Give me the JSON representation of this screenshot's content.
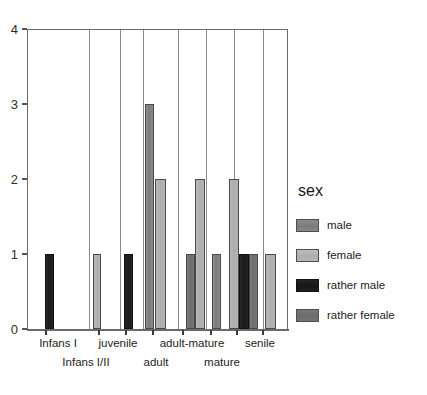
{
  "top_strip": {
    "text": "· · · ·  · ·   ·     · ·"
  },
  "chart_data": {
    "type": "bar",
    "title": "",
    "subtitle": "",
    "xlabel": "",
    "ylabel": "",
    "ylim": [
      0,
      4
    ],
    "yticks": [
      0,
      1,
      2,
      3,
      4
    ],
    "ytick_labels": [
      "0",
      "1",
      "2",
      "3",
      "4"
    ],
    "grid": false,
    "legend_position": "right",
    "legend_title": "sex",
    "categories": [
      "Infans I",
      "Infans I/II",
      "juvenile",
      "adult",
      "adult-mature",
      "mature",
      "senile"
    ],
    "category_rows": {
      "row1": [
        "Infans I",
        "juvenile",
        "adult-mature",
        "senile"
      ],
      "row2": [
        "Infans I/II",
        "adult",
        "mature"
      ]
    },
    "series": [
      {
        "name": "male",
        "color": "#808080",
        "values": [
          0,
          0,
          0,
          3,
          1,
          2,
          1
        ]
      },
      {
        "name": "female",
        "color": "#b3b3b3",
        "values": [
          0,
          0,
          1,
          2,
          2,
          1,
          1
        ]
      },
      {
        "name": "rather male",
        "color": "#1c1c1c",
        "values": [
          1,
          0,
          1,
          0,
          0,
          1,
          0
        ]
      },
      {
        "name": "rather female",
        "color": "#737373",
        "values": [
          0,
          0,
          0,
          0,
          1,
          1,
          0
        ]
      }
    ],
    "bars": [
      {
        "group": "Infans I",
        "series": "rather male",
        "value": 1,
        "x": 44,
        "w": 9
      },
      {
        "group": "juvenile",
        "series": "female",
        "value": 1,
        "x": 92,
        "w": 8
      },
      {
        "group": "juvenile",
        "series": "rather male",
        "value": 1,
        "x": 123,
        "w": 9
      },
      {
        "group": "adult",
        "series": "male",
        "value": 3,
        "x": 144,
        "w": 9
      },
      {
        "group": "adult",
        "series": "female",
        "value": 2,
        "x": 154,
        "w": 11
      },
      {
        "group": "adult-mature",
        "series": "rather female",
        "value": 1,
        "x": 185,
        "w": 9
      },
      {
        "group": "adult-mature",
        "series": "female",
        "value": 2,
        "x": 194,
        "w": 10
      },
      {
        "group": "mature",
        "series": "male",
        "value": 1,
        "x": 211,
        "w": 9
      },
      {
        "group": "mature",
        "series": "female",
        "value": 2,
        "x": 228,
        "w": 10
      },
      {
        "group": "mature",
        "series": "rather male",
        "value": 1,
        "x": 238,
        "w": 10
      },
      {
        "group": "mature",
        "series": "rather female",
        "value": 1,
        "x": 248,
        "w": 9
      },
      {
        "group": "senile",
        "series": "female",
        "value": 1,
        "x": 264,
        "w": 11
      }
    ],
    "panel_dividers": [
      88,
      119,
      142,
      177,
      205,
      233,
      262
    ],
    "xticks": [
      45,
      98,
      125,
      152,
      182,
      210,
      236,
      262
    ]
  },
  "legend": {
    "title": "sex",
    "items": [
      {
        "label": "male"
      },
      {
        "label": "female"
      },
      {
        "label": "rather male"
      },
      {
        "label": "rather female"
      }
    ]
  }
}
